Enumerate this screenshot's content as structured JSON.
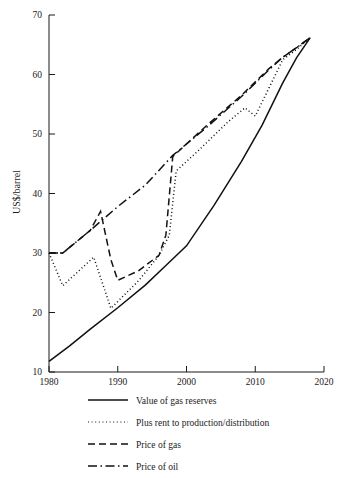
{
  "chart_data": {
    "type": "line",
    "title": "",
    "xlabel": "",
    "ylabel": "US$/barrel",
    "xlim": [
      1980,
      2020
    ],
    "ylim": [
      10,
      70
    ],
    "xticks": [
      1980,
      1990,
      2000,
      2010,
      2020
    ],
    "xtick_labels": [
      "1980",
      "1990",
      "2000",
      "2010",
      "2020"
    ],
    "yticks": [
      10,
      20,
      30,
      40,
      50,
      60,
      70
    ],
    "ytick_labels": [
      "10",
      "20",
      "30",
      "40",
      "50",
      "60",
      "70"
    ],
    "grid": false,
    "legend_position": "below",
    "series": [
      {
        "name": "Value of gas reserves",
        "style": "solid",
        "color": "#111111",
        "x": [
          1980,
          1983,
          1986,
          1990,
          1994,
          1997,
          2000,
          2004,
          2008,
          2011,
          2014,
          2016,
          2018
        ],
        "y": [
          11.8,
          14.4,
          17.2,
          20.8,
          24.6,
          27.9,
          31.2,
          38.0,
          45.4,
          51.5,
          58.6,
          62.8,
          66.2
        ]
      },
      {
        "name": "Plus rent to production/distribution",
        "style": "dotted",
        "color": "#111111",
        "x": [
          1980,
          1982,
          1986.5,
          1989,
          1993,
          1996,
          1997.5,
          1998.5,
          2002,
          2006,
          2008.5,
          2010,
          2014,
          2016,
          2018
        ],
        "y": [
          30.0,
          24.5,
          29.3,
          20.7,
          25.3,
          29.6,
          33.0,
          43.8,
          47.5,
          52.0,
          54.4,
          53.0,
          62.5,
          64.2,
          66.2
        ]
      },
      {
        "name": "Price of gas",
        "style": "dashed",
        "color": "#111111",
        "x": [
          1980,
          1982,
          1986,
          1987.5,
          1989,
          1990,
          1993,
          1996,
          1997,
          1998,
          2003,
          2008,
          2012,
          2014,
          2016,
          2018
        ],
        "y": [
          30.0,
          30.0,
          33.8,
          37.0,
          28.9,
          25.4,
          27.0,
          29.6,
          33.0,
          46.2,
          51.5,
          56.5,
          61.0,
          62.9,
          64.5,
          66.2
        ]
      },
      {
        "name": "Price of oil",
        "style": "dashdot",
        "color": "#111111",
        "x": [
          1980,
          1982,
          1986,
          1990,
          1994,
          1998,
          2003,
          2008,
          2012,
          2014,
          2016,
          2018
        ],
        "y": [
          30.0,
          30.0,
          33.8,
          37.8,
          41.4,
          46.4,
          51.2,
          56.3,
          60.8,
          62.9,
          64.5,
          66.2
        ]
      }
    ]
  },
  "axes": {
    "y_title": "US$/barrel"
  },
  "legend": {
    "items": [
      {
        "label": "Value of gas reserves",
        "style": "solid"
      },
      {
        "label": "Plus rent to production/distribution",
        "style": "dotted"
      },
      {
        "label": "Price of gas",
        "style": "dashed"
      },
      {
        "label": "Price of oil",
        "style": "dashdot"
      }
    ]
  }
}
